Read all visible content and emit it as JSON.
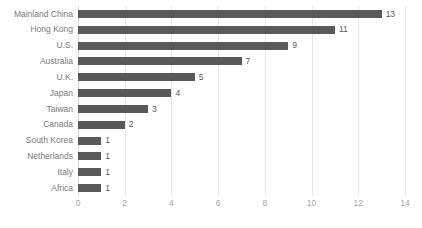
{
  "chart_data": {
    "type": "bar",
    "orientation": "horizontal",
    "title": "",
    "subtitle": "",
    "xlabel": "",
    "ylabel": "",
    "categories": [
      "Mainland China",
      "Hong Kong",
      "U.S.",
      "Australia",
      "U.K.",
      "Japan",
      "Taiwan",
      "Canada",
      "South Korea",
      "Netherlands",
      "Italy",
      "Africa"
    ],
    "values": [
      13,
      11,
      9,
      7,
      5,
      4,
      3,
      2,
      1,
      1,
      1,
      1
    ],
    "data_labels": [
      "13",
      "11",
      "9",
      "7",
      "5",
      "4",
      "3",
      "2",
      "1",
      "1",
      "1",
      "1"
    ],
    "xlim": [
      0,
      14
    ],
    "xticks": [
      0,
      2,
      4,
      6,
      8,
      10,
      12,
      14
    ],
    "xtick_labels": [
      "0",
      "2",
      "4",
      "6",
      "8",
      "10",
      "12",
      "14"
    ],
    "grid": "vertical",
    "legend": "none",
    "bar_color": "#595959",
    "gridline_color": "#e8e8e8",
    "category_label_color": "#7a7a7a",
    "tick_label_color": "#a6a6a6",
    "data_label_color": "#595959",
    "background_color": "#ffffff"
  }
}
